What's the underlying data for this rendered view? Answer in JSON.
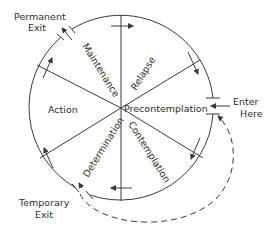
{
  "diagram": {
    "stages": [
      {
        "id": "precontemplation",
        "label": "Precontemplation"
      },
      {
        "id": "contemplation",
        "label": "Contemplation"
      },
      {
        "id": "determination",
        "label": "Determination"
      },
      {
        "id": "action",
        "label": "Action"
      },
      {
        "id": "maintenance",
        "label": "Maintenance"
      },
      {
        "id": "relapse",
        "label": "Relapse"
      }
    ],
    "entry": {
      "line1": "Enter",
      "line2": "Here"
    },
    "permanent_exit": {
      "line1": "Permanent",
      "line2": "Exit"
    },
    "temporary_exit": {
      "line1": "Temporary",
      "line2": "Exit"
    },
    "colors": {
      "line": "#3a3a3a",
      "text": "#2e2e2e",
      "background": "#ffffff"
    }
  }
}
